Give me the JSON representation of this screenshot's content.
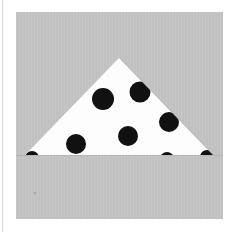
{
  "image": {
    "subject": "folded polka-dot fabric triangle",
    "colors": {
      "frame": "#ffffff",
      "background": "#c3c3c3",
      "fabric": "#fdfdfd",
      "dots": "#111111",
      "shadow": "#9e9e9e"
    },
    "triangle": {
      "apex": [
        119,
        58
      ],
      "base_left": [
        25,
        155
      ],
      "base_right": [
        213,
        155
      ]
    },
    "dots": [
      {
        "cx": 103,
        "cy": 99,
        "r": 11
      },
      {
        "cx": 140,
        "cy": 92,
        "r": 10.5
      },
      {
        "cx": 169,
        "cy": 122,
        "r": 10
      },
      {
        "cx": 76,
        "cy": 144,
        "r": 10
      },
      {
        "cx": 128,
        "cy": 136,
        "r": 10
      },
      {
        "cx": 167,
        "cy": 159,
        "r": 7
      },
      {
        "cx": 207,
        "cy": 157,
        "r": 7
      },
      {
        "cx": 32,
        "cy": 158,
        "r": 7
      }
    ]
  }
}
